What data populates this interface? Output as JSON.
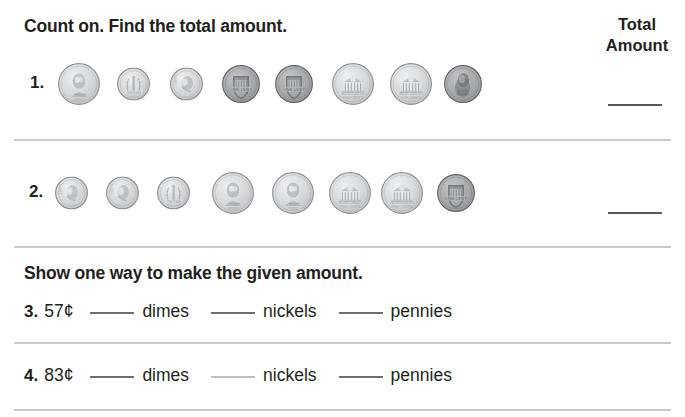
{
  "worksheet": {
    "instructions": {
      "count_on": "Count on. Find the total amount.",
      "show_way": "Show one way to make the given amount."
    },
    "total_column": {
      "line1": "Total",
      "line2": "Amount"
    },
    "count_on_items": [
      {
        "number": "1.",
        "coins": [
          {
            "type": "nickel",
            "face": "obverse",
            "value_cents": 5
          },
          {
            "type": "dime",
            "face": "reverse",
            "value_cents": 10
          },
          {
            "type": "dime",
            "face": "obverse",
            "value_cents": 10
          },
          {
            "type": "penny",
            "face": "reverse",
            "value_cents": 1
          },
          {
            "type": "penny",
            "face": "reverse",
            "value_cents": 1
          },
          {
            "type": "nickel",
            "face": "reverse",
            "value_cents": 5
          },
          {
            "type": "nickel",
            "face": "reverse",
            "value_cents": 5
          },
          {
            "type": "penny",
            "face": "obverse",
            "value_cents": 1
          }
        ],
        "answer_blank": ""
      },
      {
        "number": "2.",
        "coins": [
          {
            "type": "dime",
            "face": "obverse",
            "value_cents": 10
          },
          {
            "type": "dime",
            "face": "obverse",
            "value_cents": 10
          },
          {
            "type": "dime",
            "face": "reverse",
            "value_cents": 10
          },
          {
            "type": "nickel",
            "face": "obverse",
            "value_cents": 5
          },
          {
            "type": "nickel",
            "face": "obverse",
            "value_cents": 5
          },
          {
            "type": "nickel",
            "face": "reverse",
            "value_cents": 5
          },
          {
            "type": "nickel",
            "face": "reverse",
            "value_cents": 5
          },
          {
            "type": "penny",
            "face": "reverse",
            "value_cents": 1
          }
        ],
        "answer_blank": ""
      }
    ],
    "make_amount_items": [
      {
        "number": "3.",
        "amount": "57¢",
        "fields": [
          {
            "blank": "",
            "label": "dimes"
          },
          {
            "blank": "",
            "label": "nickels"
          },
          {
            "blank": "",
            "label": "pennies"
          }
        ]
      },
      {
        "number": "4.",
        "amount": "83¢",
        "fields": [
          {
            "blank": "",
            "label": "dimes"
          },
          {
            "blank": "",
            "label": "nickels"
          },
          {
            "blank": "",
            "label": "pennies"
          }
        ]
      }
    ],
    "colors": {
      "text": "#231f20",
      "divider": "#c9cacc",
      "blank_line": "#58595b",
      "silver_coin": "#d3d4d6",
      "copper_coin": "#9a9b9d"
    }
  }
}
